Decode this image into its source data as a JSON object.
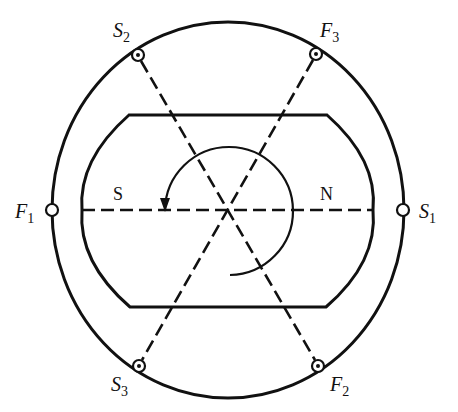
{
  "diagram": {
    "type": "three-phase stator winding with two-pole rotor",
    "colors": {
      "line": "#111111",
      "background": "#ffffff"
    },
    "terminals": [
      {
        "id": "F1",
        "letter": "F",
        "sub": "1",
        "x": 52,
        "y": 210,
        "marker": "open-circle"
      },
      {
        "id": "S1",
        "letter": "S",
        "sub": "1",
        "x": 403,
        "y": 210,
        "marker": "open-circle"
      },
      {
        "id": "S2",
        "letter": "S",
        "sub": "2",
        "x": 138,
        "y": 55,
        "marker": "dot-circle"
      },
      {
        "id": "F3",
        "letter": "F",
        "sub": "3",
        "x": 316,
        "y": 54,
        "marker": "dot-circle"
      },
      {
        "id": "S3",
        "letter": "S",
        "sub": "3",
        "x": 139,
        "y": 366,
        "marker": "dot-circle"
      },
      {
        "id": "F2",
        "letter": "F",
        "sub": "2",
        "x": 318,
        "y": 366,
        "marker": "dot-circle"
      }
    ],
    "poles": {
      "south": "S",
      "north": "N"
    },
    "rotation": "clockwise-arrow"
  }
}
